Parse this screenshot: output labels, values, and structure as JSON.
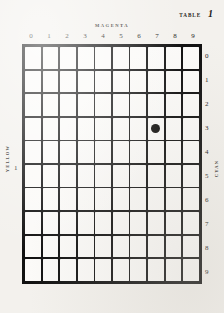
{
  "caption": {
    "word": "TABLE",
    "number": "1"
  },
  "axes": {
    "top_title": "MAGENTA",
    "left_title": "YELLOW",
    "right_title": "CYAN",
    "column_labels": [
      "0",
      "1",
      "2",
      "3",
      "4",
      "5",
      "6",
      "7",
      "8",
      "9"
    ],
    "row_labels": [
      "0",
      "1",
      "2",
      "3",
      "4",
      "5",
      "6",
      "7",
      "8",
      "9"
    ]
  },
  "left_stray_number": "1",
  "chart_data": {
    "type": "table",
    "title": "TABLE 1",
    "xlabel": "MAGENTA",
    "ylabel": "YELLOW",
    "y2label": "CYAN",
    "grid": true,
    "columns": 10,
    "rows": 10,
    "categories": [
      "0",
      "1",
      "2",
      "3",
      "4",
      "5",
      "6",
      "7",
      "8",
      "9"
    ],
    "row_categories": [
      "0",
      "1",
      "2",
      "3",
      "4",
      "5",
      "6",
      "7",
      "8",
      "9"
    ],
    "markers": [
      {
        "column": 7,
        "row": 3,
        "shape": "filled-circle",
        "color": "#0b0a09"
      }
    ],
    "colors": {
      "grid_line": "#111111",
      "cell_fill": "#fbfaf8",
      "paper": "#f3f1ed",
      "text": "#1d1b19"
    }
  }
}
